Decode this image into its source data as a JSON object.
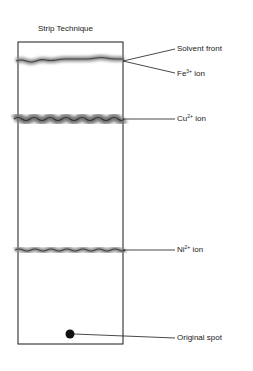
{
  "diagram": {
    "title": "Strip Technique",
    "labels": {
      "solvent_front": "Solvent front",
      "fe": {
        "base": "Fe",
        "sup": "3+",
        "suffix": " ion"
      },
      "cu": {
        "base": "Cu",
        "sup": "2+",
        "suffix": " ion"
      },
      "ni": {
        "base": "Ni",
        "sup": "2+",
        "suffix": " ion"
      },
      "original_spot": "Original spot"
    },
    "colors": {
      "line": "#1a1a1a",
      "band": "#555555",
      "band_glow": "#9a9a9a"
    }
  }
}
